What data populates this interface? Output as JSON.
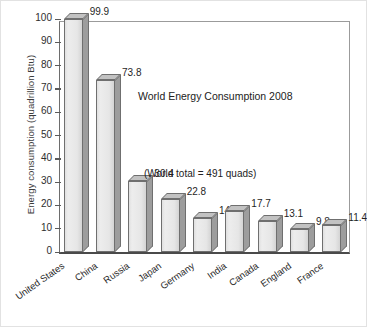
{
  "chart_data": {
    "type": "bar",
    "title": "World Energy Consumption 2008",
    "annotation": "(World total = 491 quads)",
    "xlabel": "",
    "ylabel": "Energy consumption (quadrillion Btu)",
    "categories": [
      "United States",
      "China",
      "Russia",
      "Japan",
      "Germany",
      "India",
      "Canada",
      "England",
      "France"
    ],
    "values": [
      99.9,
      73.8,
      30.4,
      22.8,
      14.6,
      17.7,
      13.1,
      9.8,
      11.4
    ],
    "value_labels": [
      "99.9",
      "73.8",
      "30.4",
      "22.8",
      "14.6",
      "17.7",
      "13.1",
      "9.8",
      "11.4"
    ],
    "ylim": [
      0,
      100
    ],
    "yticks": [
      0,
      10,
      20,
      30,
      40,
      50,
      60,
      70,
      80,
      90,
      100
    ],
    "ytick_labels": [
      "0",
      "10",
      "20",
      "30",
      "40",
      "50",
      "60",
      "70",
      "80",
      "90",
      "100"
    ],
    "grid": false,
    "legend": null,
    "style": {
      "bar_front": "#ededed",
      "bar_side": "#9d9d9d",
      "bar_top": "#c2c2c2",
      "bar_edge": "#6f6f6f",
      "axis": "#4a4a4a",
      "text": "#222222",
      "background": "#ffffff"
    }
  }
}
